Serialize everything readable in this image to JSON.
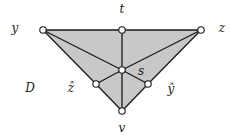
{
  "diagram": {
    "colors": {
      "fill": "#c8c8c8",
      "stroke": "#1a1a1a",
      "node_fill": "#ffffff"
    },
    "region_label": "D",
    "nodes": [
      {
        "id": "y",
        "label": "y",
        "x": 43,
        "y": 30,
        "lx": 15,
        "ly": 28
      },
      {
        "id": "t",
        "label": "t",
        "x": 122,
        "y": 30,
        "lx": 122,
        "ly": 9
      },
      {
        "id": "z",
        "label": "z",
        "x": 201,
        "y": 30,
        "lx": 222,
        "ly": 28
      },
      {
        "id": "s",
        "label": "s",
        "x": 122,
        "y": 70,
        "lx": 141,
        "ly": 71
      },
      {
        "id": "zhat",
        "label": "ẑ",
        "x": 96,
        "y": 84,
        "lx": 71,
        "ly": 88
      },
      {
        "id": "yhat",
        "label": "ŷ",
        "x": 148,
        "y": 84,
        "lx": 171,
        "ly": 89
      },
      {
        "id": "v",
        "label": "v",
        "x": 122,
        "y": 111,
        "lx": 122,
        "ly": 128
      }
    ],
    "edges": [
      [
        "y",
        "t"
      ],
      [
        "t",
        "z"
      ],
      [
        "y",
        "zhat"
      ],
      [
        "zhat",
        "v"
      ],
      [
        "z",
        "yhat"
      ],
      [
        "yhat",
        "v"
      ],
      [
        "t",
        "s"
      ],
      [
        "s",
        "v"
      ],
      [
        "y",
        "s"
      ],
      [
        "s",
        "yhat"
      ],
      [
        "z",
        "s"
      ],
      [
        "s",
        "zhat"
      ]
    ],
    "region_label_pos": {
      "x": 30,
      "y": 88
    }
  }
}
